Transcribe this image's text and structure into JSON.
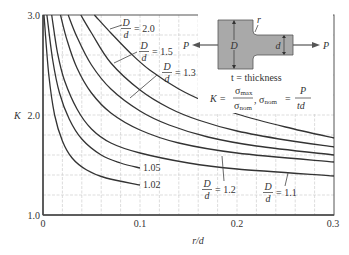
{
  "chart_data": {
    "type": "line",
    "title": "",
    "xlabel": "r/d",
    "ylabel": "K",
    "xlim": [
      0,
      0.3
    ],
    "ylim": [
      1.0,
      3.0
    ],
    "grid": true,
    "x_ticks": [
      "0",
      "0.1",
      "0.2",
      "0.3"
    ],
    "y_ticks": [
      "1.0",
      "2.0",
      "3.0"
    ],
    "series": [
      {
        "name": "D/d = 2.0",
        "label_num": "D",
        "label_den": "d",
        "label_val": "= 2.0",
        "x": [
          0.053,
          0.07,
          0.09,
          0.11,
          0.14,
          0.17,
          0.2,
          0.25,
          0.3
        ],
        "y": [
          3.0,
          2.82,
          2.62,
          2.45,
          2.26,
          2.12,
          2.01,
          1.88,
          1.77
        ]
      },
      {
        "name": "D/d = 1.5",
        "label_num": "D",
        "label_den": "d",
        "label_val": "= 1.5",
        "x": [
          0.039,
          0.05,
          0.07,
          0.1,
          0.13,
          0.16,
          0.2,
          0.25,
          0.3
        ],
        "y": [
          3.0,
          2.82,
          2.52,
          2.25,
          2.07,
          1.95,
          1.84,
          1.75,
          1.68
        ]
      },
      {
        "name": "D/d = 1.3",
        "label_num": "D",
        "label_den": "d",
        "label_val": "= 1.3",
        "x": [
          0.026,
          0.035,
          0.05,
          0.07,
          0.1,
          0.13,
          0.17,
          0.22,
          0.3
        ],
        "y": [
          3.0,
          2.78,
          2.5,
          2.26,
          2.04,
          1.9,
          1.78,
          1.69,
          1.6
        ]
      },
      {
        "name": "D/d = 1.2",
        "label_num": "D",
        "label_den": "d",
        "label_val": "= 1.2",
        "x": [
          0.018,
          0.025,
          0.035,
          0.05,
          0.07,
          0.1,
          0.14,
          0.2,
          0.3
        ],
        "y": [
          3.0,
          2.74,
          2.47,
          2.22,
          2.02,
          1.85,
          1.72,
          1.62,
          1.53
        ]
      },
      {
        "name": "D/d = 1.1",
        "label_num": "D",
        "label_den": "d",
        "label_val": "= 1.1",
        "x": [
          0.009,
          0.015,
          0.022,
          0.035,
          0.05,
          0.07,
          0.1,
          0.15,
          0.2,
          0.3
        ],
        "y": [
          3.0,
          2.62,
          2.35,
          2.06,
          1.86,
          1.72,
          1.62,
          1.52,
          1.46,
          1.39
        ]
      },
      {
        "name": "1.05",
        "label_val": "1.05",
        "x": [
          0.004,
          0.01,
          0.017,
          0.027,
          0.04,
          0.06,
          0.08,
          0.1
        ],
        "y": [
          3.0,
          2.55,
          2.22,
          1.96,
          1.76,
          1.6,
          1.52,
          1.47
        ]
      },
      {
        "name": "1.02",
        "label_val": "1.02",
        "x": [
          0.001,
          0.006,
          0.012,
          0.02,
          0.03,
          0.045,
          0.065,
          0.1
        ],
        "y": [
          3.0,
          2.4,
          2.0,
          1.74,
          1.57,
          1.45,
          1.37,
          1.3
        ]
      }
    ],
    "inset": {
      "force_label": "P",
      "big_width_label": "D",
      "small_width_label": "d",
      "radius_label": "r",
      "thickness_note": "t = thickness",
      "formula_k": "K =",
      "sigma_max": "σ",
      "sigma_max_sub": "max",
      "sigma_nom": "σ",
      "sigma_nom_sub": "nom",
      "formula_nom_eq": "=",
      "formula_p": "P",
      "formula_td": "td",
      "fill_color": "#a9a9a9"
    }
  }
}
